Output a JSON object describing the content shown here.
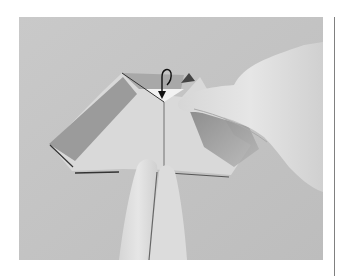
{
  "figure": {
    "arrow": "curved-fold-back-arrow",
    "colors": {
      "page_background": "#ffffff",
      "photo_background": "#c6c6c6",
      "paper_light": "#dadada",
      "paper_dark_band": "#9a9a9a",
      "hand_tone": "#e2e2e2",
      "shadow": "#6e6e6e",
      "rule": "#808080"
    }
  }
}
